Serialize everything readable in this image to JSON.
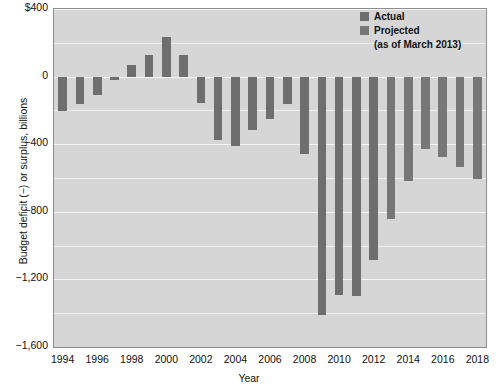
{
  "chart_data": {
    "type": "bar",
    "title": "",
    "xlabel": "Year",
    "ylabel": "Budget deficit (−) or surplus, billions",
    "ylim": [
      -1600,
      400
    ],
    "ytick_labels": [
      "$400",
      "0",
      "−400",
      "−800",
      "−1,200",
      "−1,600"
    ],
    "ytick_values": [
      400,
      0,
      -400,
      -800,
      -1200,
      -1600
    ],
    "xtick_labels": [
      "1994",
      "1996",
      "1998",
      "2000",
      "2002",
      "2004",
      "2006",
      "2008",
      "2010",
      "2012",
      "2014",
      "2016",
      "2018"
    ],
    "grid": true,
    "legend_position": "top-right",
    "series": [
      {
        "name": "Actual",
        "color": "#6e6e6e",
        "categories": [
          1994,
          1995,
          1996,
          1997,
          1998,
          1999,
          2000,
          2001,
          2002,
          2003,
          2004,
          2005,
          2006,
          2007,
          2008,
          2009,
          2010,
          2011,
          2012
        ],
        "values": [
          -203,
          -164,
          -107,
          -22,
          69,
          126,
          236,
          128,
          -158,
          -378,
          -413,
          -318,
          -248,
          -161,
          -459,
          -1413,
          -1294,
          -1300,
          -1087
        ]
      },
      {
        "name": "Projected (as of March 2013)",
        "color": "#777777",
        "categories": [
          2013,
          2014,
          2015,
          2016,
          2017,
          2018
        ],
        "values": [
          -845,
          -616,
          -430,
          -476,
          -535,
          -605
        ]
      }
    ]
  },
  "legend": {
    "actual_label": "Actual",
    "projected_label": "Projected",
    "projected_note": "(as of March 2013)",
    "actual_color": "#6e6e6e",
    "projected_color": "#777777"
  },
  "axes": {
    "x_title": "Year",
    "y_title": "Budget deficit (−) or surplus, billions"
  }
}
